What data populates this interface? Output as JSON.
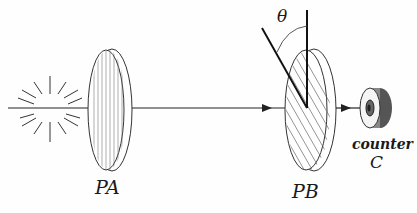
{
  "diagram": {
    "labels": {
      "polarizer_a": "PA",
      "polarizer_b": "PB",
      "angle": "θ",
      "counter_word": "counter",
      "counter_letter": "C"
    },
    "elements": [
      {
        "id": "light-source",
        "kind": "starburst"
      },
      {
        "id": "beam",
        "kind": "line",
        "direction": "left-to-right"
      },
      {
        "id": "polarizer-a",
        "kind": "disc",
        "hatch": "vertical"
      },
      {
        "id": "polarizer-b",
        "kind": "disc",
        "hatch": "diagonal",
        "axis_angle_label": "θ"
      },
      {
        "id": "counter",
        "kind": "detector"
      }
    ],
    "colors": {
      "ink": "#1a1a1a",
      "background": "#fefefe"
    }
  }
}
